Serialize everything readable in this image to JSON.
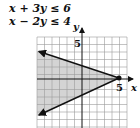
{
  "system": {
    "inequality_1": "x + 3y ≤ 6",
    "inequality_2": "x − 2y ≤ 4"
  },
  "graph": {
    "x_axis_label": "x",
    "y_axis_label": "y",
    "x_tick_label": "5",
    "y_tick_label": "5",
    "vertex_point": "(5, 0)",
    "shade_color": "#d4d4d4",
    "line_color": "#111111",
    "grid_color": "#9a9a9a"
  }
}
